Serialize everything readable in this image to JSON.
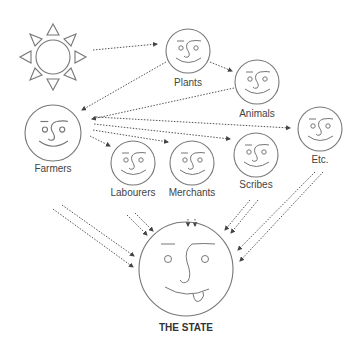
{
  "diagram": {
    "title": "",
    "nodes": [
      {
        "id": "sun",
        "label": "",
        "icon": "sun-icon"
      },
      {
        "id": "plants",
        "label": "Plants",
        "icon": "smiling-face-icon"
      },
      {
        "id": "animals",
        "label": "Animals",
        "icon": "smiling-face-icon"
      },
      {
        "id": "farmers",
        "label": "Farmers",
        "icon": "smiling-face-icon"
      },
      {
        "id": "labourers",
        "label": "Labourers",
        "icon": "smiling-face-icon"
      },
      {
        "id": "merchants",
        "label": "Merchants",
        "icon": "smiling-face-icon"
      },
      {
        "id": "scribes",
        "label": "Scribes",
        "icon": "smiling-face-icon"
      },
      {
        "id": "etc",
        "label": "Etc.",
        "icon": "smiling-face-icon"
      },
      {
        "id": "state",
        "label": "THE STATE",
        "icon": "tongue-out-face-icon"
      }
    ],
    "edges": [
      {
        "from": "sun",
        "to": "plants",
        "style": "dotted"
      },
      {
        "from": "plants",
        "to": "animals",
        "style": "dotted"
      },
      {
        "from": "plants",
        "to": "farmers",
        "style": "dotted"
      },
      {
        "from": "animals",
        "to": "farmers",
        "style": "dotted"
      },
      {
        "from": "farmers",
        "to": "labourers",
        "style": "dotted"
      },
      {
        "from": "farmers",
        "to": "merchants",
        "style": "dotted"
      },
      {
        "from": "farmers",
        "to": "scribes",
        "style": "dotted"
      },
      {
        "from": "farmers",
        "to": "etc",
        "style": "dotted"
      },
      {
        "from": "farmers",
        "to": "state",
        "style": "double-dotted"
      },
      {
        "from": "labourers",
        "to": "state",
        "style": "double-dotted"
      },
      {
        "from": "merchants",
        "to": "state",
        "style": "double-dotted"
      },
      {
        "from": "scribes",
        "to": "state",
        "style": "double-dotted"
      },
      {
        "from": "etc",
        "to": "state",
        "style": "double-dotted"
      }
    ],
    "colors": {
      "stroke": "#777777",
      "text": "#444444",
      "arrow": "#555555",
      "background": "#ffffff"
    }
  }
}
